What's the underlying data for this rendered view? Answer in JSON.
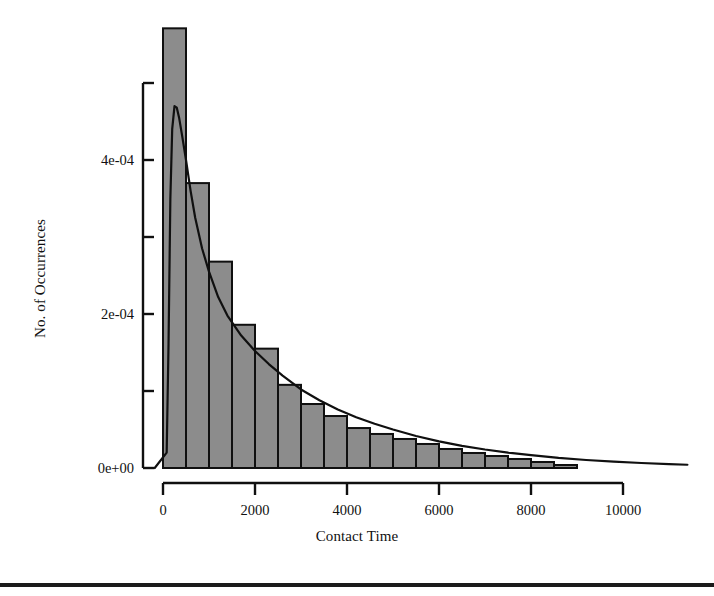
{
  "chart_data": {
    "type": "bar",
    "title": "",
    "subtitle": "",
    "xlabel": "Contact Time",
    "ylabel": "No. of Occurrences",
    "xlim": [
      -250,
      11500
    ],
    "ylim": [
      0,
      0.00052
    ],
    "grid": false,
    "legend": null,
    "bar_color": "#8c8c8c",
    "bar_edge_color": "#101010",
    "curve_color": "#101010",
    "axis_color": "#101010",
    "xticks": [
      0,
      2000,
      4000,
      6000,
      8000,
      10000
    ],
    "xtick_labels": [
      "0",
      "2000",
      "4000",
      "6000",
      "8000",
      "10000"
    ],
    "yticks": [
      0,
      0.0001,
      0.0002,
      0.0003,
      0.0004,
      0.0005
    ],
    "ytick_labels": [
      "0e+00",
      "",
      "2e-04",
      "",
      "4e-04",
      ""
    ],
    "ytick_labels_shown": [
      "0e+00",
      "2e-04",
      "4e-04"
    ],
    "bin_width": 500,
    "bar_edges": [
      0,
      500,
      1000,
      1500,
      2000,
      2500,
      3000,
      3500,
      4000,
      4500,
      5000,
      5500,
      6000,
      6500,
      7000,
      7500,
      8000,
      8500,
      9000
    ],
    "categories": [
      "0-500",
      "500-1000",
      "1000-1500",
      "1500-2000",
      "2000-2500",
      "2500-3000",
      "3000-3500",
      "3500-4000",
      "4000-4500",
      "4500-5000",
      "5000-5500",
      "5500-6000",
      "6000-6500",
      "6500-7000",
      "7000-7500",
      "7500-8000",
      "8000-8500",
      "8500-9000"
    ],
    "values": [
      0.000571,
      0.00037,
      0.000268,
      0.000186,
      0.000155,
      0.000108,
      8.31e-05,
      6.75e-05,
      5.19e-05,
      4.42e-05,
      3.77e-05,
      3.12e-05,
      2.47e-05,
      1.95e-05,
      1.56e-05,
      1.17e-05,
      7.8e-06,
      3.9e-06
    ],
    "series": [
      {
        "name": "density",
        "type": "line",
        "x": [
          80,
          120,
          160,
          200,
          250,
          300,
          350,
          420,
          500,
          600,
          700,
          850,
          1000,
          1200,
          1400,
          1700,
          2000,
          2300,
          2600,
          3000,
          3400,
          3800,
          4200,
          4600,
          5000,
          5500,
          6000,
          6500,
          7000,
          7500,
          8000,
          8600,
          9200,
          9800,
          10400,
          11000,
          11400
        ],
        "y": [
          2e-05,
          0.00016,
          0.00035,
          0.00044,
          0.00047,
          0.000468,
          0.000455,
          0.00043,
          0.0004,
          0.00036,
          0.000325,
          0.000285,
          0.000255,
          0.000222,
          0.000198,
          0.000172,
          0.000152,
          0.000135,
          0.00012,
          0.000102,
          8.8e-05,
          7.6e-05,
          6.6e-05,
          5.75e-05,
          5e-05,
          4.15e-05,
          3.45e-05,
          2.88e-05,
          2.4e-05,
          2e-05,
          1.68e-05,
          1.32e-05,
          1.04e-05,
          8.2e-06,
          6.5e-06,
          5e-06,
          4.2e-06
        ]
      }
    ],
    "curve_peak": {
      "x": 260,
      "y": 0.00047
    }
  },
  "figure": {
    "x_axis_label": "Contact Time",
    "y_axis_label": "No. of Occurrences"
  }
}
